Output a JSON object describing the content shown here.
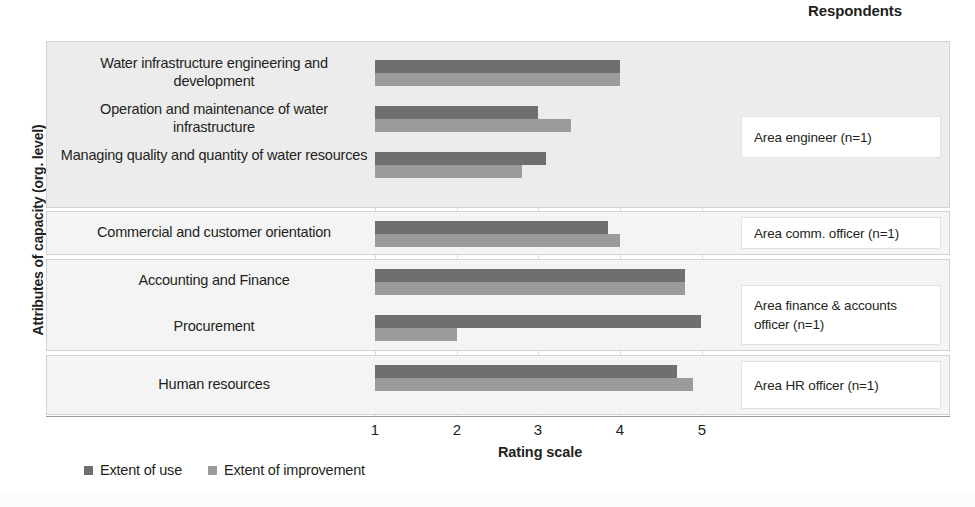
{
  "header": {
    "respondents_label": "Respondents"
  },
  "axes": {
    "y_title": "Attributes of capacity (org. level)",
    "x_title": "Rating scale",
    "x_ticks": [
      "1",
      "2",
      "3",
      "4",
      "5"
    ]
  },
  "legend": {
    "items": [
      {
        "label": "Extent of use",
        "color": "#6f6f6f",
        "key": "use"
      },
      {
        "label": "Extent of improvement",
        "color": "#9b9b9b",
        "key": "improvement"
      }
    ]
  },
  "respondents": [
    {
      "label": "Area engineer (n=1)"
    },
    {
      "label": "Area comm. officer (n=1)"
    },
    {
      "label": "Area finance & accounts officer (n=1)"
    },
    {
      "label": "Area HR officer (n=1)"
    }
  ],
  "categories": [
    {
      "label": "Water infrastructure engineering and development"
    },
    {
      "label": "Operation and maintenance of  water infrastructure"
    },
    {
      "label": "Managing quality and quantity of water resources"
    },
    {
      "label": "Commercial and customer orientation"
    },
    {
      "label": "Accounting and Finance"
    },
    {
      "label": "Procurement"
    },
    {
      "label": "Human resources"
    }
  ],
  "chart_data": {
    "type": "bar",
    "orientation": "horizontal",
    "title": "",
    "xlabel": "Rating scale",
    "ylabel": "Attributes of capacity (org. level)",
    "xlim": [
      1,
      5.6
    ],
    "xticks": [
      1,
      2,
      3,
      4,
      5
    ],
    "grid": true,
    "legend_position": "bottom-left",
    "categories": [
      "Water infrastructure engineering and development",
      "Operation and maintenance of  water infrastructure",
      "Managing quality and quantity of water resources",
      "Commercial and customer orientation",
      "Accounting and Finance",
      "Procurement",
      "Human resources"
    ],
    "series": [
      {
        "name": "Extent of use",
        "color": "#6f6f6f",
        "values": [
          4.0,
          3.0,
          3.1,
          3.85,
          4.8,
          5.0,
          4.7
        ]
      },
      {
        "name": "Extent of improvement",
        "color": "#9b9b9b",
        "values": [
          4.0,
          3.4,
          2.8,
          4.0,
          4.8,
          2.0,
          4.9
        ]
      }
    ],
    "respondent_groups": [
      {
        "respondent": "Area engineer (n=1)",
        "categories": [
          0,
          1,
          2
        ]
      },
      {
        "respondent": "Area comm. officer (n=1)",
        "categories": [
          3
        ]
      },
      {
        "respondent": "Area finance & accounts officer (n=1)",
        "categories": [
          4,
          5
        ]
      },
      {
        "respondent": "Area HR officer (n=1)",
        "categories": [
          6
        ]
      }
    ]
  }
}
